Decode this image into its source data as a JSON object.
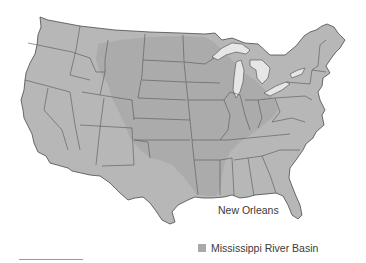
{
  "map": {
    "title": "",
    "region": "Contiguous United States",
    "colors": {
      "land": "#b7b7b7",
      "basin": "#a9a9a9",
      "state_border": "#555555",
      "water": "#e6e6e6",
      "background": "#ffffff"
    },
    "labels": {
      "city": "New Orleans"
    },
    "legend": {
      "items": [
        {
          "label": "Mississippi River Basin",
          "color": "#a9a9a9"
        }
      ]
    }
  }
}
